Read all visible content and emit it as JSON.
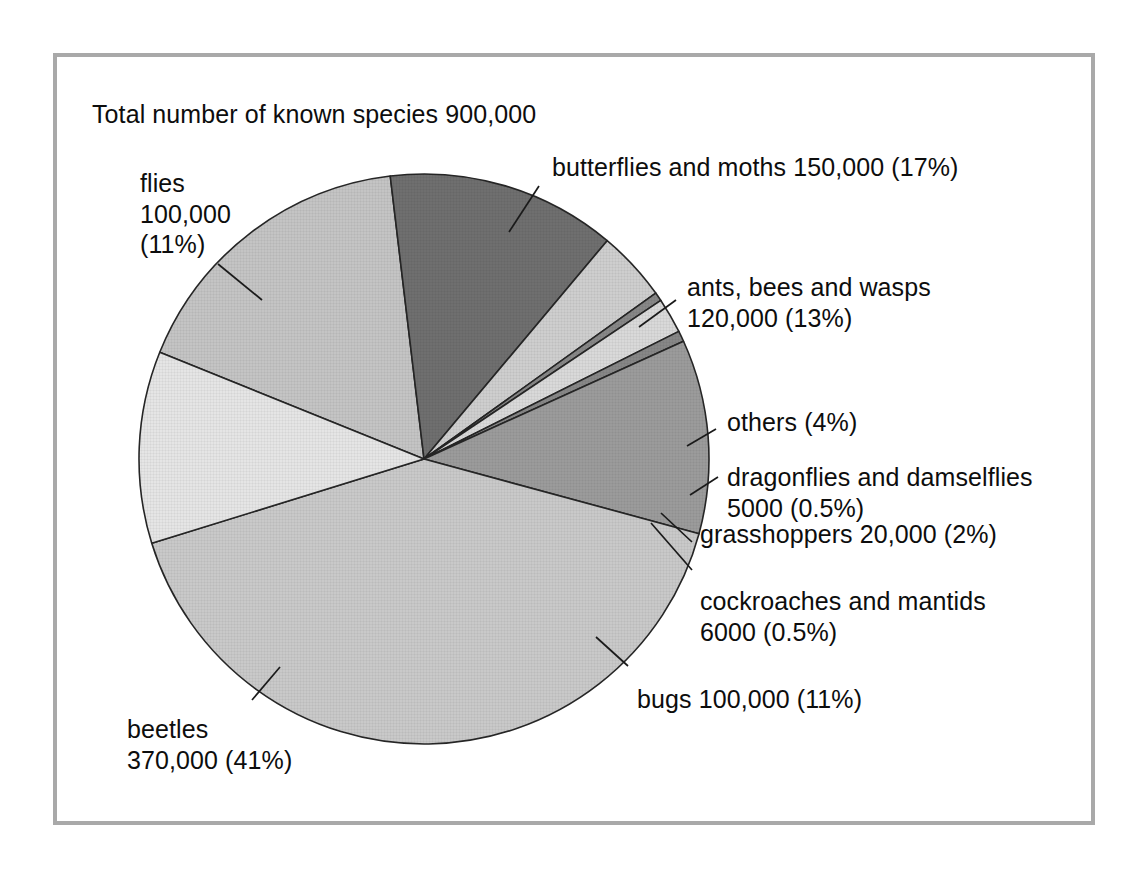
{
  "figure": {
    "title": "Total number of known species 900,000",
    "frame_color": "#a9a9a9",
    "background": "#ffffff"
  },
  "chart_data": {
    "type": "pie",
    "title": "Total number of known species 900,000",
    "xlabel": "",
    "ylabel": "",
    "total_label": "Total number of known species 900,000",
    "total_value": 900000,
    "units": "known species",
    "legend_position": "callout-labels",
    "grid": false,
    "categories": [
      "butterflies and moths",
      "ants, bees and wasps",
      "others",
      "dragonflies and damselflies",
      "grasshoppers",
      "cockroaches and mantids",
      "bugs",
      "beetles",
      "flies"
    ],
    "values": [
      150000,
      120000,
      36000,
      5000,
      20000,
      6000,
      100000,
      370000,
      100000
    ],
    "percentages": [
      17,
      13,
      4,
      0.5,
      2,
      0.5,
      11,
      41,
      11
    ],
    "slices": [
      {
        "name": "butterflies and moths",
        "label_line1": "butterflies and moths 150,000 (17%)",
        "label_line2": "",
        "value": 150000,
        "value_text": "150,000",
        "percent": 17,
        "percent_text": "(17%)",
        "color": "#c4c4c4",
        "start_angle": -68,
        "end_angle": -6.8
      },
      {
        "name": "ants, bees and wasps",
        "label_line1": "ants, bees and wasps",
        "label_line2": "120,000 (13%)",
        "value": 120000,
        "value_text": "120,000",
        "percent": 13,
        "percent_text": "(13%)",
        "color": "#6f6f6f",
        "start_angle": -6.8,
        "end_angle": 40.0
      },
      {
        "name": "others",
        "label_line1": "others (4%)",
        "label_line2": "",
        "value": 36000,
        "value_text": "",
        "percent": 4,
        "percent_text": "(4%)",
        "color": "#cecece",
        "start_angle": 40.0,
        "end_angle": 54.4
      },
      {
        "name": "dragonflies and damselflies",
        "label_line1": "dragonflies and damselflies",
        "label_line2": "5000 (0.5%)",
        "value": 5000,
        "value_text": "5000",
        "percent": 0.5,
        "percent_text": "(0.5%)",
        "color": "#878787",
        "start_angle": 54.4,
        "end_angle": 56.2
      },
      {
        "name": "grasshoppers",
        "label_line1": "grasshoppers 20,000 (2%)",
        "label_line2": "",
        "value": 20000,
        "value_text": "20,000",
        "percent": 2,
        "percent_text": "(2%)",
        "color": "#d9d9d9",
        "start_angle": 56.2,
        "end_angle": 63.4
      },
      {
        "name": "cockroaches and mantids",
        "label_line1": "cockroaches and mantids",
        "label_line2": "6000 (0.5%)",
        "value": 6000,
        "value_text": "6000",
        "percent": 0.5,
        "percent_text": "(0.5%)",
        "color": "#878787",
        "start_angle": 63.4,
        "end_angle": 65.6
      },
      {
        "name": "bugs",
        "label_line1": "bugs 100,000 (11%)",
        "label_line2": "",
        "value": 100000,
        "value_text": "100,000",
        "percent": 11,
        "percent_text": "(11%)",
        "color": "#9b9b9b",
        "start_angle": 65.6,
        "end_angle": 105.2
      },
      {
        "name": "beetles",
        "label_line1": "beetles",
        "label_line2": "370,000 (41%)",
        "value": 370000,
        "value_text": "370,000",
        "percent": 41,
        "percent_text": "(41%)",
        "color": "#c9c9c9",
        "start_angle": 105.2,
        "end_angle": 252.8
      },
      {
        "name": "flies",
        "label_line1": "flies",
        "label_line2": "100,000",
        "label_line3": "(11%)",
        "value": 100000,
        "value_text": "100,000",
        "percent": 11,
        "percent_text": "(11%)",
        "color": "#e5e5e5",
        "start_angle": 252.8,
        "end_angle": 292.0
      }
    ]
  },
  "labels": {
    "flies": {
      "line1": "flies",
      "line2": "100,000",
      "line3": "(11%)"
    },
    "butterflies": {
      "line1": "butterflies and moths 150,000 (17%)"
    },
    "ants": {
      "line1": "ants, bees and wasps",
      "line2": "120,000 (13%)"
    },
    "others": {
      "line1": "others (4%)"
    },
    "dragonflies": {
      "line1": "dragonflies and damselflies",
      "line2": "5000 (0.5%)"
    },
    "grasshoppers": {
      "line1": "grasshoppers 20,000 (2%)"
    },
    "cockroaches": {
      "line1": "cockroaches and mantids",
      "line2": "6000 (0.5%)"
    },
    "bugs": {
      "line1": "bugs 100,000 (11%)"
    },
    "beetles": {
      "line1": "beetles",
      "line2": "370,000 (41%)"
    }
  }
}
